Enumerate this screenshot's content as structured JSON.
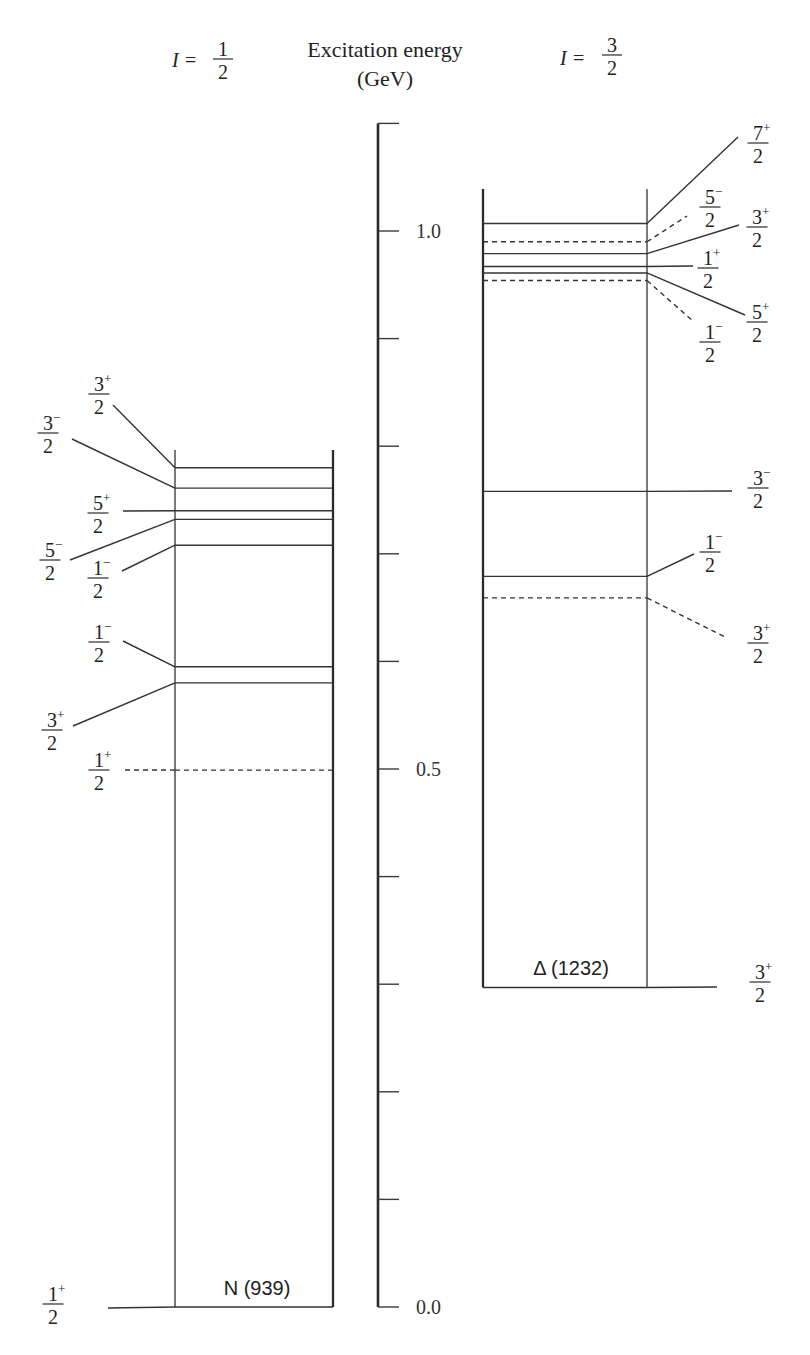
{
  "header": {
    "left": {
      "variable": "I",
      "equals": "=",
      "num": "1",
      "den": "2"
    },
    "axis_title": {
      "line1": "Excitation energy",
      "line2": "(GeV)"
    },
    "right": {
      "variable": "I",
      "equals": "=",
      "num": "3",
      "den": "2"
    }
  },
  "axis": {
    "min": 0.0,
    "max": 1.1,
    "tick_step": 0.1,
    "unit": "GeV",
    "labels": [
      {
        "value": 1.0,
        "text": "1.0"
      },
      {
        "value": 0.5,
        "text": "0.5"
      },
      {
        "value": 0.0,
        "text": "0.0"
      }
    ]
  },
  "nucleon": {
    "name": "N (939)",
    "isospin": "1/2",
    "levels": [
      {
        "energy": 0.0,
        "j_num": "1",
        "j_den": "2",
        "parity": "+",
        "style": "solid"
      },
      {
        "energy": 0.499,
        "j_num": "1",
        "j_den": "2",
        "parity": "+",
        "style": "dashed"
      },
      {
        "energy": 0.58,
        "j_num": "3",
        "j_den": "2",
        "parity": "+",
        "style": "solid"
      },
      {
        "energy": 0.595,
        "j_num": "1",
        "j_den": "2",
        "parity": "−",
        "style": "solid"
      },
      {
        "energy": 0.708,
        "j_num": "1",
        "j_den": "2",
        "parity": "−",
        "style": "solid"
      },
      {
        "energy": 0.732,
        "j_num": "5",
        "j_den": "2",
        "parity": "−",
        "style": "solid"
      },
      {
        "energy": 0.74,
        "j_num": "5",
        "j_den": "2",
        "parity": "+",
        "style": "solid"
      },
      {
        "energy": 0.761,
        "j_num": "3",
        "j_den": "2",
        "parity": "−",
        "style": "solid"
      },
      {
        "energy": 0.78,
        "j_num": "3",
        "j_den": "2",
        "parity": "+",
        "style": "solid"
      }
    ]
  },
  "delta": {
    "name": "Δ (1232)",
    "isospin": "3/2",
    "levels": [
      {
        "energy": 0.297,
        "j_num": "3",
        "j_den": "2",
        "parity": "+",
        "style": "solid"
      },
      {
        "energy": 0.659,
        "j_num": "3",
        "j_den": "2",
        "parity": "+",
        "style": "dashed"
      },
      {
        "energy": 0.679,
        "j_num": "1",
        "j_den": "2",
        "parity": "−",
        "style": "solid"
      },
      {
        "energy": 0.758,
        "j_num": "3",
        "j_den": "2",
        "parity": "−",
        "style": "solid"
      },
      {
        "energy": 0.954,
        "j_num": "1",
        "j_den": "2",
        "parity": "−",
        "style": "dashed"
      },
      {
        "energy": 0.961,
        "j_num": "5",
        "j_den": "2",
        "parity": "+",
        "style": "solid"
      },
      {
        "energy": 0.967,
        "j_num": "1",
        "j_den": "2",
        "parity": "+",
        "style": "solid"
      },
      {
        "energy": 0.979,
        "j_num": "3",
        "j_den": "2",
        "parity": "+",
        "style": "solid"
      },
      {
        "energy": 0.99,
        "j_num": "5",
        "j_den": "2",
        "parity": "−",
        "style": "dashed"
      },
      {
        "energy": 1.007,
        "j_num": "7",
        "j_den": "2",
        "parity": "+",
        "style": "solid"
      }
    ]
  }
}
